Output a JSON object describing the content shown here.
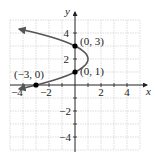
{
  "chart_data": {
    "type": "line",
    "title": "",
    "xlabel": "x",
    "ylabel": "y",
    "xlim": [
      -5,
      5
    ],
    "ylim": [
      -5,
      5
    ],
    "grid": true,
    "x_ticks": [
      -4,
      -2,
      2,
      4
    ],
    "y_ticks": [
      4,
      2,
      -2,
      -4
    ],
    "x_tick_labels": [
      "−4",
      "−2",
      "2",
      "4"
    ],
    "y_tick_labels": [
      "4",
      "2",
      "−2",
      "−4"
    ],
    "series": [
      {
        "name": "parabola x = 1 − (y − 2)²",
        "equation": "x = -(y-2)^2 + 1",
        "vertex": [
          1,
          2
        ],
        "opens": "left",
        "arrows": "both ends",
        "y_range": [
          -0.3,
          4.3
        ],
        "color": "#555555"
      }
    ],
    "points": [
      {
        "x": 0,
        "y": 3,
        "label": "(0, 3)"
      },
      {
        "x": 0,
        "y": 1,
        "label": "(0, 1)"
      },
      {
        "x": -3,
        "y": 0,
        "label": "(−3, 0)"
      }
    ]
  },
  "axes": {
    "x_label": "x",
    "y_label": "y"
  },
  "ticks": {
    "x": [
      "−4",
      "−2",
      "2",
      "4"
    ],
    "y": [
      "4",
      "2",
      "−2",
      "−4"
    ]
  },
  "labels": {
    "p03": "(0, 3)",
    "p01": "(0, 1)",
    "pm30": "(−3, 0)"
  },
  "colors": {
    "curve": "#555555",
    "points": "#000000",
    "grid": "#c8c8c8",
    "axis": "#222222"
  }
}
